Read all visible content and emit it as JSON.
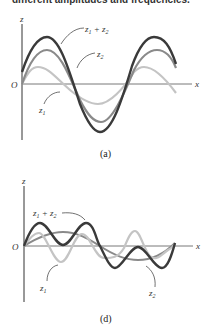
{
  "header": {
    "caption": "different amplitudes and frequencies."
  },
  "figures": [
    {
      "id": "a",
      "label": "(a)",
      "axis_z": "z",
      "axis_x": "x",
      "origin": "O",
      "curves": [
        {
          "name": "z1",
          "label_main": "z",
          "label_sub": "1",
          "color": "#c4c4c4"
        },
        {
          "name": "z2",
          "label_main": "z",
          "label_sub": "2",
          "color": "#8a8a8a"
        },
        {
          "name": "z1+z2",
          "label_main": "z",
          "label_sub": "1",
          "label_plus": " + z",
          "label_sub2": "2",
          "color": "#3a3a3a"
        }
      ]
    },
    {
      "id": "d",
      "label": "(d)",
      "axis_z": "z",
      "axis_x": "x",
      "origin": "O",
      "curves": [
        {
          "name": "z1",
          "label_main": "z",
          "label_sub": "1",
          "color": "#c4c4c4"
        },
        {
          "name": "z2",
          "label_main": "z",
          "label_sub": "2",
          "color": "#8a8a8a"
        },
        {
          "name": "z1+z2",
          "label_main": "z",
          "label_sub": "1",
          "label_plus": " + z",
          "label_sub2": "2",
          "color": "#3a3a3a"
        }
      ]
    }
  ]
}
